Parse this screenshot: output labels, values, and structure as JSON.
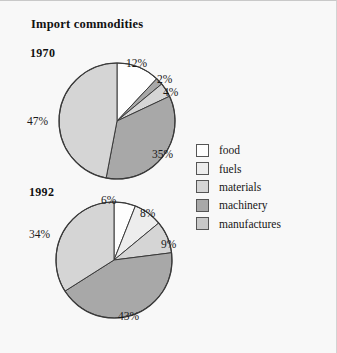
{
  "title": "Import commodities",
  "legend": {
    "items": [
      {
        "label": "food",
        "color": "#fefefe"
      },
      {
        "label": "fuels",
        "color": "#ededed"
      },
      {
        "label": "materials",
        "color": "#d5d5d5"
      },
      {
        "label": "machinery",
        "color": "#a8a8a8"
      },
      {
        "label": "manufactures",
        "color": "#c8c8c8"
      }
    ]
  },
  "chart_data": [
    {
      "type": "pie",
      "title": "1970",
      "categories": [
        "food",
        "fuels",
        "materials",
        "machinery",
        "manufactures"
      ],
      "values": [
        12,
        2,
        4,
        35,
        47
      ],
      "labels": [
        "12%",
        "2%",
        "4%",
        "35%",
        "47%"
      ],
      "colors": [
        "#fefefe",
        "#a8a8a8",
        "#d5d5d5",
        "#a8a8a8",
        "#d5d5d5"
      ],
      "units": "percent",
      "start_angle": 0,
      "direction": "clockwise",
      "legend_position": "right"
    },
    {
      "type": "pie",
      "title": "1992",
      "categories": [
        "food",
        "fuels",
        "materials",
        "machinery",
        "manufactures"
      ],
      "values": [
        6,
        8,
        9,
        43,
        34
      ],
      "labels": [
        "6%",
        "8%",
        "9%",
        "43%",
        "34%"
      ],
      "colors": [
        "#fefefe",
        "#ededed",
        "#d5d5d5",
        "#a8a8a8",
        "#d5d5d5"
      ],
      "units": "percent",
      "start_angle": 0,
      "direction": "clockwise",
      "legend_position": "right"
    }
  ]
}
